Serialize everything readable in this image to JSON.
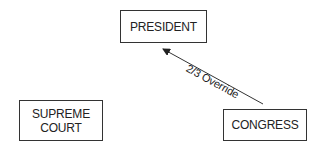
{
  "nodes": {
    "president": "PRESIDENT",
    "supreme_court": "SUPREME\nCOURT",
    "supreme_court_line1": "SUPREME",
    "supreme_court_line2": "COURT",
    "congress": "CONGRESS"
  },
  "edges": [
    {
      "from": "CONGRESS",
      "to": "PRESIDENT",
      "label": "2/3 Override"
    }
  ],
  "edge_label": "2/3 Override"
}
